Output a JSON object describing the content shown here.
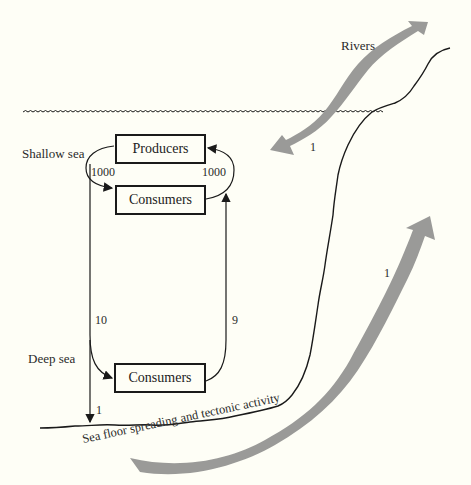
{
  "diagram": {
    "zones": {
      "shallow": "Shallow sea",
      "deep": "Deep sea"
    },
    "boxes": {
      "producers": "Producers",
      "consumers_shallow": "Consumers",
      "consumers_deep": "Consumers"
    },
    "flows": {
      "producers_to_consumers": "1000",
      "consumers_to_producers": "1000",
      "shallow_to_deep": "10",
      "deep_to_shallow": "9",
      "deep_to_floor": "1",
      "rivers_input": "1",
      "tectonic_return": "1"
    },
    "sources": {
      "rivers": "Rivers",
      "sea_floor": "Sea floor spreading and tectonic activity"
    },
    "colors": {
      "background": "#fefef6",
      "line": "#1a1a1a",
      "gray_arrow": "#9a9a98"
    }
  }
}
